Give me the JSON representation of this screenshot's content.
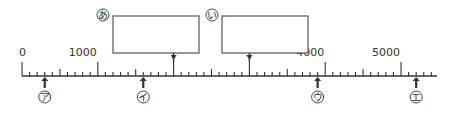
{
  "number_line": {
    "min": 0,
    "max": 5400,
    "major_step": 1000,
    "medium_step": 500,
    "minor_step": 100,
    "tick_labels": [
      {
        "value": 0,
        "text": "0"
      },
      {
        "value": 1000,
        "text": "1000"
      },
      {
        "value": 4000,
        "text": "4000"
      },
      {
        "value": 5000,
        "text": "5000"
      }
    ]
  },
  "answer_boxes": [
    {
      "label": "あ",
      "points_to": 2000,
      "value": ""
    },
    {
      "label": "い",
      "points_to": 3000,
      "value": ""
    }
  ],
  "markers": [
    {
      "label": "ア",
      "value": 300
    },
    {
      "label": "イ",
      "value": 1600
    },
    {
      "label": "ウ",
      "value": 3900
    },
    {
      "label": "エ",
      "value": 5200
    }
  ],
  "colors": {
    "line": "#333333",
    "box_border": "#555555"
  }
}
